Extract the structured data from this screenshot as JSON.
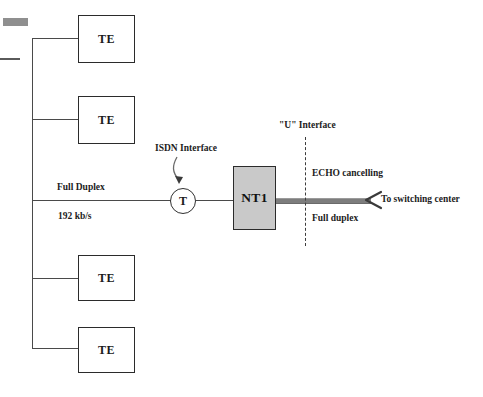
{
  "diagram": {
    "terminals": [
      {
        "label": "TE"
      },
      {
        "label": "TE"
      },
      {
        "label": "TE"
      },
      {
        "label": "TE"
      }
    ],
    "reference_point": {
      "label": "T"
    },
    "network_termination": {
      "label": "NT1"
    },
    "annotations": {
      "isdn_interface": "ISDN Interface",
      "u_interface": "\"U\" Interface",
      "full_duplex_bus": "Full Duplex",
      "bus_rate": "192 kb/s",
      "echo_cancelling": "ECHO cancelling",
      "full_duplex_u": "Full duplex",
      "to_switching_center": "To switching center"
    },
    "colors": {
      "nt1_fill": "#c9c9c9",
      "nt1_border": "#2b2b2b",
      "wire": "#4a4a4a",
      "u_link": "#7d7d7d",
      "dash": "#3c3c3c",
      "text": "#1c1c1c"
    }
  }
}
